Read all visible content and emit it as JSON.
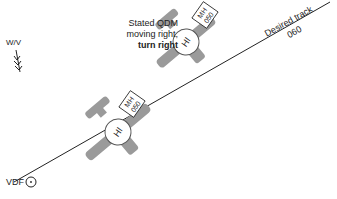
{
  "labels": {
    "wind": "W/V",
    "vdf": "VDF",
    "stated_line1": "Stated QDM",
    "stated_line2": "moving right,",
    "stated_line3": "turn right",
    "desired_track": "Desired track",
    "track_value": "060",
    "hi": "HI",
    "mh_label": "MH",
    "mh_value": "050"
  },
  "caption": "",
  "colors": {
    "aircraft_fill": "#9a9a9a",
    "line": "#222222",
    "text": "#222222"
  }
}
